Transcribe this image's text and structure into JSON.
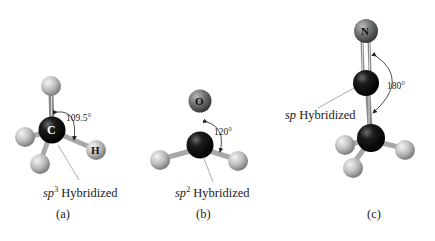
{
  "figure": {
    "panels": [
      {
        "id": "a",
        "caption": "(a)",
        "hybridization_prefix": "sp",
        "hybridization_sup": "3",
        "hybridization_suffix": " Hybridized",
        "angle": "109.5°",
        "central_atom": "C",
        "labeled_atom": "H"
      },
      {
        "id": "b",
        "caption": "(b)",
        "hybridization_prefix": "sp",
        "hybridization_sup": "2",
        "hybridization_suffix": " Hybridized",
        "angle": "120°",
        "labeled_atom": "O"
      },
      {
        "id": "c",
        "caption": "(c)",
        "hybridization_prefix": "sp",
        "hybridization_sup": "",
        "hybridization_suffix": " Hybridized",
        "angle": "180°",
        "labeled_atom": "N"
      }
    ],
    "colors": {
      "carbon": "#111111",
      "hydrogen": "#bdbdbd",
      "heteroatom": "#6e6e6e",
      "bond": "#a8a8a8",
      "text": "#1a1a1a",
      "background": "#ffffff"
    }
  }
}
